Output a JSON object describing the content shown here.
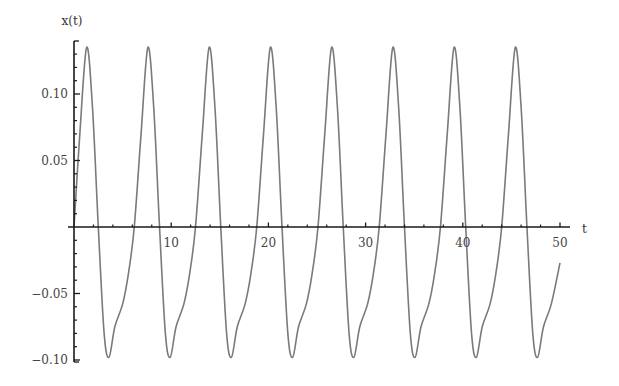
{
  "chart_data": {
    "type": "line",
    "title": "",
    "xlabel": "t",
    "ylabel": "x(t)",
    "xlim": [
      0,
      50
    ],
    "ylim": [
      -0.1,
      0.135
    ],
    "grid": false,
    "legend": null,
    "x_ticks": [
      10,
      20,
      30,
      40,
      50
    ],
    "x_tick_labels": [
      "10",
      "20",
      "30",
      "40",
      "50"
    ],
    "x_minor_ticks": [
      2,
      4,
      6,
      8,
      12,
      14,
      16,
      18,
      22,
      24,
      26,
      28,
      32,
      34,
      36,
      38,
      42,
      44,
      46,
      48
    ],
    "y_ticks": [
      -0.1,
      -0.05,
      0.05,
      0.1
    ],
    "y_tick_labels": [
      "-0.10",
      "-0.05",
      "0.05",
      "0.10"
    ],
    "y_minor_ticks": [
      -0.09,
      -0.08,
      -0.07,
      -0.06,
      -0.04,
      -0.03,
      -0.02,
      -0.01,
      0.01,
      0.02,
      0.03,
      0.04,
      0.06,
      0.07,
      0.08,
      0.09,
      0.11,
      0.12,
      0.13
    ],
    "series": [
      {
        "name": "x(t)",
        "color": "#7a7a7a",
        "period": 6.32,
        "peak_value": 0.135,
        "trough_value": -0.098,
        "peaks_t": [
          1.3,
          7.6,
          13.9,
          20.2,
          26.5,
          32.8,
          39.1,
          45.4
        ],
        "troughs_t": [
          3.6,
          9.9,
          16.2,
          22.5,
          28.8,
          35.1,
          41.4,
          47.7
        ],
        "cycle_shape": [
          [
            0.0,
            0.0
          ],
          [
            0.1,
            0.07
          ],
          [
            0.2,
            0.135
          ],
          [
            0.28,
            0.09
          ],
          [
            0.33,
            0.0
          ],
          [
            0.4,
            -0.08
          ],
          [
            0.44,
            -0.098
          ],
          [
            0.52,
            -0.075
          ],
          [
            0.6,
            -0.058
          ],
          [
            0.7,
            -0.035
          ],
          [
            0.8,
            -0.01
          ],
          [
            0.85,
            0.0
          ],
          [
            1.0,
            0.07
          ]
        ],
        "x": [
          0,
          0.6,
          1.3,
          1.9,
          2.5,
          3.1,
          3.6,
          4.2,
          5.0,
          5.6,
          6.2,
          6.9,
          7.6,
          8.2,
          8.8,
          9.4,
          9.9,
          10.5,
          11.3,
          11.9,
          12.5,
          13.2,
          13.9,
          14.5,
          15.1,
          15.7,
          16.2,
          16.8,
          17.6,
          18.2,
          18.8,
          19.5,
          20.2,
          20.8,
          21.4,
          22.0,
          22.5,
          23.1,
          23.9,
          24.5,
          25.1,
          25.8,
          26.5,
          27.1,
          27.7,
          28.3,
          28.8,
          29.4,
          30.2,
          30.8,
          31.4,
          32.1,
          32.8,
          33.4,
          34.0,
          34.6,
          35.1,
          35.7,
          36.5,
          37.1,
          37.7,
          38.4,
          39.1,
          39.7,
          40.3,
          40.9,
          41.4,
          42.0,
          42.8,
          43.4,
          44.0,
          44.7,
          45.4,
          46.0,
          46.6,
          47.2,
          47.7,
          48.3,
          49.1,
          50.0
        ],
        "y": [
          0.0,
          0.07,
          0.135,
          0.09,
          0.0,
          -0.08,
          -0.098,
          -0.075,
          -0.058,
          -0.035,
          0.0,
          0.07,
          0.135,
          0.09,
          0.0,
          -0.08,
          -0.098,
          -0.075,
          -0.058,
          -0.035,
          0.0,
          0.07,
          0.135,
          0.09,
          0.0,
          -0.08,
          -0.098,
          -0.075,
          -0.058,
          -0.035,
          0.0,
          0.07,
          0.135,
          0.09,
          0.0,
          -0.08,
          -0.098,
          -0.075,
          -0.058,
          -0.035,
          0.0,
          0.07,
          0.135,
          0.09,
          0.0,
          -0.08,
          -0.098,
          -0.075,
          -0.058,
          -0.035,
          0.0,
          0.07,
          0.135,
          0.09,
          0.0,
          -0.08,
          -0.098,
          -0.075,
          -0.058,
          -0.035,
          0.0,
          0.07,
          0.135,
          0.09,
          0.0,
          -0.08,
          -0.098,
          -0.075,
          -0.058,
          -0.035,
          0.0,
          0.07,
          0.135,
          0.09,
          0.0,
          -0.08,
          -0.098,
          -0.075,
          -0.058,
          -0.027
        ]
      }
    ]
  },
  "plot": {
    "origin_px": [
      74,
      227
    ],
    "x_px_per_unit": 9.72,
    "y_px_per_unit": 1330,
    "x_axis_end_px": 570,
    "y_axis_top_px": 41,
    "y_axis_bottom_px": 362,
    "axis_color": "#1a1a1a",
    "background": "#ffffff"
  }
}
